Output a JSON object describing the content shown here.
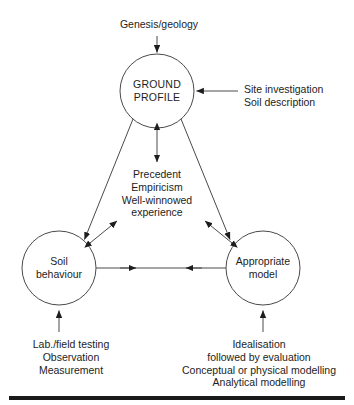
{
  "figure": {
    "background_color": "#ffffff",
    "line_color": "#4a4a4a",
    "text_color": "#1d1d1d",
    "rule_color": "#1a1a1a"
  },
  "nodes": {
    "ground_profile": {
      "label": "GROUND\nPROFILE",
      "cx": 157,
      "cy": 91,
      "r": 37
    },
    "soil_behaviour": {
      "label": "Soil\nbehaviour",
      "cx": 59,
      "cy": 268,
      "r": 37
    },
    "appropriate_model": {
      "label": "Appropriate\nmodel",
      "cx": 263,
      "cy": 268,
      "r": 37
    }
  },
  "annotations": {
    "genesis": "Genesis/geology",
    "site_investigation": "Site investigation\nSoil description",
    "precedent": "Precedent\nEmpiricism\nWell-winnowed\nexperience",
    "lab_testing": "Lab./field testing\nObservation\nMeasurement",
    "idealisation": "Idealisation\nfollowed by evaluation\nConceptual or physical modelling\nAnalytical modelling"
  },
  "connections": [
    {
      "name": "genesis-to-ground-profile",
      "from": "Genesis/geology",
      "to": "GROUND PROFILE",
      "arrowheads": "single-down"
    },
    {
      "name": "site-investigation-to-ground-profile",
      "from": "Site investigation / Soil description",
      "to": "GROUND PROFILE",
      "arrowheads": "single-left"
    },
    {
      "name": "ground-profile-to-soil-behaviour",
      "from": "GROUND PROFILE",
      "to": "Soil behaviour",
      "arrowheads": "double"
    },
    {
      "name": "ground-profile-to-appropriate-model",
      "from": "GROUND PROFILE",
      "to": "Appropriate model",
      "arrowheads": "double"
    },
    {
      "name": "soil-behaviour-to-appropriate-model",
      "from": "Soil behaviour",
      "to": "Appropriate model",
      "arrowheads": "double"
    },
    {
      "name": "ground-profile-precedent-stub",
      "from": "GROUND PROFILE",
      "to": "Precedent / Empiricism / Well-winnowed experience",
      "arrowheads": "double"
    },
    {
      "name": "lab-testing-to-soil-behaviour",
      "from": "Lab./field testing / Observation / Measurement",
      "to": "Soil behaviour",
      "arrowheads": "single-up"
    },
    {
      "name": "idealisation-to-appropriate-model",
      "from": "Idealisation / followed by evaluation / Conceptual or physical modelling / Analytical modelling",
      "to": "Appropriate model",
      "arrowheads": "single-up"
    }
  ]
}
